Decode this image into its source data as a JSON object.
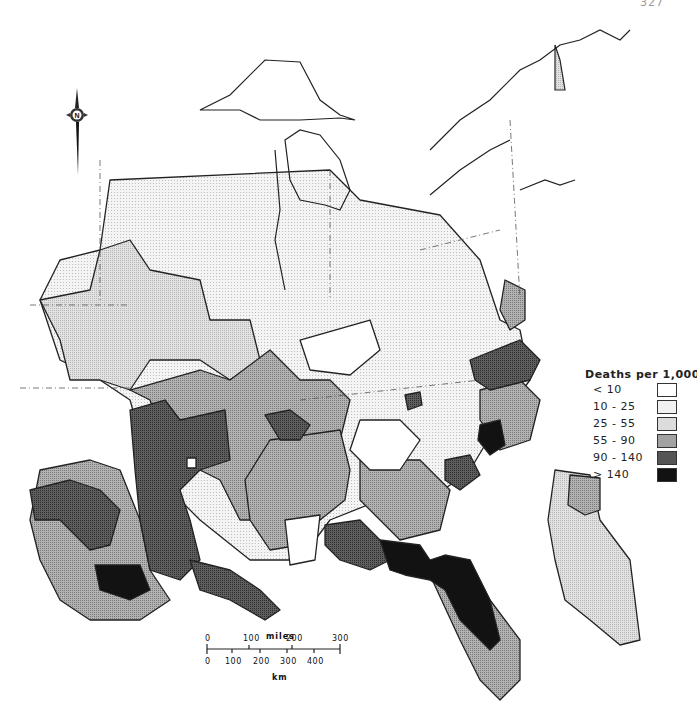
{
  "page": {
    "number_fragment": "327"
  },
  "map": {
    "subject": "Eastern United States with California inset",
    "compass": {
      "label": "N",
      "icon": "north-arrow-icon"
    }
  },
  "legend": {
    "title": "Deaths per 1,000",
    "items": [
      {
        "label": "< 10",
        "fill": "#ffffff",
        "pattern": "none"
      },
      {
        "label": "10 - 25",
        "fill": "#f1f1f1",
        "pattern": "fine-grid"
      },
      {
        "label": "25 - 55",
        "fill": "#dcdcdc",
        "pattern": "dots"
      },
      {
        "label": "55 - 90",
        "fill": "#a2a2a2",
        "pattern": "halftone"
      },
      {
        "label": "90 - 140",
        "fill": "#555555",
        "pattern": "dark-halftone"
      },
      {
        "label": "> 140",
        "fill": "#121212",
        "pattern": "solid"
      }
    ]
  },
  "scale": {
    "title": "miles",
    "miles_ticks": [
      "0",
      "100",
      "200",
      "300"
    ],
    "km_ticks": [
      "0",
      "100",
      "200",
      "300",
      "400"
    ],
    "km_label": "km"
  }
}
